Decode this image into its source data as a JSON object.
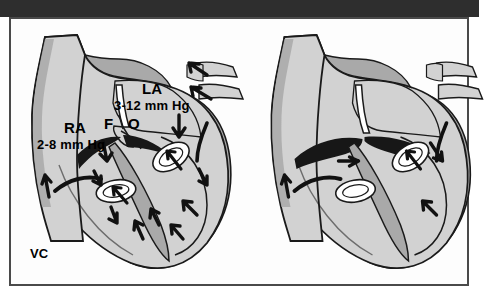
{
  "figure": {
    "domain": "medical-illustration",
    "topic": "Patent foramen ovale versus closed interatrial septum",
    "frame": {
      "band_color": "#2e2e2e",
      "border_color": "#4a4a4a",
      "background": "#fdfdfd"
    }
  },
  "palette": {
    "chamber_light": "#d2d2d2",
    "myocardium_mid": "#a9a9a9",
    "myocardium_dark": "#9a9a9a",
    "outline": "#1a1a1a",
    "septum_fused": "#171717",
    "valve_fill": "#ffffff",
    "text": "#000000"
  },
  "panels": [
    {
      "id": "left",
      "name": "patent-foramen-ovale",
      "labels": [
        {
          "key": "la",
          "text": "LA"
        },
        {
          "key": "la_p",
          "text": "3-12 mm Hg"
        },
        {
          "key": "ra",
          "text": "RA"
        },
        {
          "key": "ra_p",
          "text": "2-8 mm Hg"
        },
        {
          "key": "fo_f",
          "text": "F"
        },
        {
          "key": "fo_o",
          "text": "O"
        },
        {
          "key": "vc",
          "text": "VC"
        }
      ],
      "features": [
        "superior vena cava inflow",
        "right atrium chamber",
        "left atrium chamber",
        "pulmonary vein inflow arrows",
        "patent foramen ovale flap open",
        "tricuspid valve ellipse",
        "mitral valve ellipse",
        "interventricular septum",
        "right ventricle flow arrows",
        "left ventricle flow arrows"
      ],
      "flow_arrow_count": 13
    },
    {
      "id": "right",
      "name": "closed-interatrial-septum",
      "labels": [],
      "features": [
        "superior vena cava inflow",
        "right atrium chamber",
        "left atrium chamber",
        "fused interatrial septum (closed)",
        "tricuspid valve ellipse",
        "mitral valve ellipse",
        "interventricular septum",
        "ventricular flow arrows"
      ],
      "flow_arrow_count": 6
    }
  ]
}
